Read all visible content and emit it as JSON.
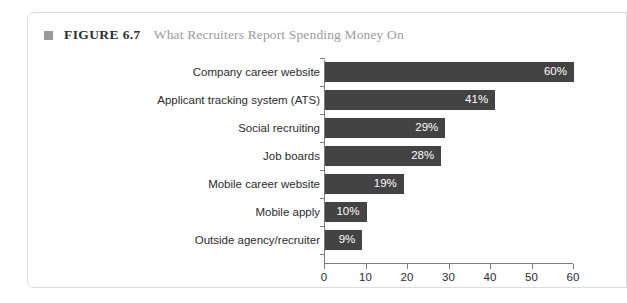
{
  "figure": {
    "marker_icon": "square-bullet-icon",
    "number_label": "FIGURE 6.7",
    "title": "What Recruiters Report Spending Money On",
    "marker_color": "#9a9a9a",
    "number_color": "#2e2e2e",
    "title_color": "#9b9b9b",
    "border_color": "#dcdcdc"
  },
  "chart_data": {
    "type": "bar",
    "orientation": "horizontal",
    "title": "What Recruiters Report Spending Money On",
    "xlabel": "",
    "ylabel": "",
    "xlim": [
      0,
      60
    ],
    "grid": false,
    "legend": null,
    "bar_color": "#434343",
    "value_label_color": "#ffffff",
    "value_suffix": "%",
    "xticks": [
      0,
      10,
      20,
      30,
      40,
      50,
      60
    ],
    "xtick_labels": [
      "0",
      "10",
      "20",
      "30",
      "40",
      "50",
      "60"
    ],
    "categories": [
      "Company career website",
      "Applicant tracking system (ATS)",
      "Social recruiting",
      "Job boards",
      "Mobile career website",
      "Mobile apply",
      "Outside agency/recruiter"
    ],
    "values": [
      60,
      41,
      29,
      28,
      19,
      10,
      9
    ],
    "value_labels": [
      "60%",
      "41%",
      "29%",
      "28%",
      "19%",
      "10%",
      "9%"
    ]
  }
}
